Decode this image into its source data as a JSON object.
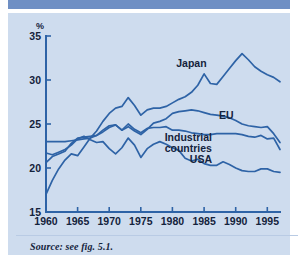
{
  "figure": {
    "background_color": "#cedcee",
    "accent_color": "#2e63a6",
    "band_color": "#6f8fc4",
    "source_note": "Source: see fig. 5.1.",
    "unit_label": "%"
  },
  "chart_data": {
    "type": "line",
    "title": "",
    "xlabel": "",
    "ylabel": "%",
    "xlim": [
      1960,
      1997
    ],
    "ylim": [
      15,
      35
    ],
    "yticks": [
      15,
      20,
      25,
      30,
      35
    ],
    "xticks": [
      1960,
      1965,
      1970,
      1975,
      1980,
      1985,
      1990,
      1995
    ],
    "grid": false,
    "legend": "inline-labels",
    "x": [
      1960,
      1961,
      1962,
      1963,
      1964,
      1965,
      1966,
      1967,
      1968,
      1969,
      1970,
      1971,
      1972,
      1973,
      1974,
      1975,
      1976,
      1977,
      1978,
      1979,
      1980,
      1981,
      1982,
      1983,
      1984,
      1985,
      1986,
      1987,
      1988,
      1989,
      1990,
      1991,
      1992,
      1993,
      1994,
      1995,
      1996,
      1997
    ],
    "series": [
      {
        "name": "Japan",
        "label": "Japan",
        "values": [
          17.0,
          18.6,
          19.9,
          20.9,
          21.6,
          21.4,
          22.4,
          23.4,
          24.2,
          25.3,
          26.2,
          26.8,
          27.0,
          28.0,
          27.1,
          26.0,
          26.6,
          26.8,
          26.8,
          27.0,
          27.4,
          27.8,
          28.1,
          28.6,
          29.4,
          30.7,
          29.6,
          29.5,
          30.4,
          31.3,
          32.2,
          33.0,
          32.3,
          31.5,
          31.0,
          30.6,
          30.3,
          29.8
        ]
      },
      {
        "name": "EU",
        "label": "EU",
        "values": [
          20.6,
          21.3,
          21.6,
          21.9,
          22.8,
          23.4,
          23.5,
          23.6,
          23.7,
          24.3,
          24.8,
          24.9,
          24.3,
          24.7,
          24.2,
          23.8,
          24.4,
          25.1,
          25.3,
          25.6,
          26.2,
          26.4,
          26.5,
          26.6,
          26.5,
          26.3,
          26.1,
          26.0,
          25.9,
          25.7,
          25.4,
          25.0,
          24.8,
          24.7,
          24.6,
          24.7,
          23.9,
          22.9
        ]
      },
      {
        "name": "Industrial countries",
        "label": "Industrial countries",
        "values": [
          23.0,
          23.0,
          23.0,
          23.0,
          23.1,
          23.2,
          23.3,
          23.4,
          23.7,
          24.1,
          24.6,
          24.9,
          24.3,
          25.0,
          24.4,
          24.0,
          24.5,
          24.6,
          24.6,
          24.7,
          24.3,
          24.3,
          24.2,
          24.0,
          23.9,
          23.8,
          23.8,
          23.9,
          23.9,
          23.9,
          23.9,
          23.8,
          23.6,
          23.5,
          23.7,
          23.3,
          23.4,
          22.1
        ]
      },
      {
        "name": "USA",
        "label": "USA",
        "values": [
          21.7,
          21.5,
          21.8,
          22.1,
          22.6,
          23.3,
          23.6,
          23.2,
          22.9,
          23.0,
          22.2,
          21.6,
          22.3,
          23.4,
          22.6,
          21.2,
          22.2,
          22.7,
          23.0,
          22.7,
          22.3,
          22.0,
          21.1,
          20.8,
          21.0,
          20.5,
          20.3,
          20.3,
          20.7,
          20.4,
          20.0,
          19.7,
          19.6,
          19.6,
          19.9,
          19.9,
          19.6,
          19.5
        ]
      }
    ],
    "series_label_positions": [
      {
        "name": "Japan",
        "x": 1983.0,
        "y": 31.5
      },
      {
        "name": "EU",
        "x": 1988.5,
        "y": 25.6
      },
      {
        "name": "Industrial countries",
        "x": 1982.5,
        "y": 23.1
      },
      {
        "name": "USA",
        "x": 1984.5,
        "y": 20.6
      }
    ]
  }
}
